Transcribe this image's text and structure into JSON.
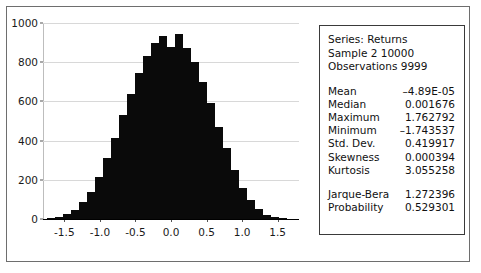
{
  "chart_data": {
    "type": "bar",
    "title": "",
    "xlabel": "",
    "ylabel": "",
    "xlim": [
      -1.8,
      1.8
    ],
    "ylim": [
      0,
      1000
    ],
    "grid": true,
    "legend": null,
    "y_ticks": [
      0,
      200,
      400,
      600,
      800,
      1000
    ],
    "y_tick_labels": [
      "0",
      "200",
      "400",
      "600",
      "800",
      "1000"
    ],
    "x_ticks": [
      -1.5,
      -1.0,
      -0.5,
      0.0,
      0.5,
      1.0,
      1.5
    ],
    "x_tick_labels": [
      "-1.5",
      "-1.0",
      "-0.5",
      "0.0",
      "0.5",
      "1.0",
      "1.5"
    ],
    "bin_width": 0.1125,
    "bin_centers": [
      -1.6875,
      -1.575,
      -1.4625,
      -1.35,
      -1.2375,
      -1.125,
      -1.0125,
      -0.9,
      -0.7875,
      -0.675,
      -0.5625,
      -0.45,
      -0.3375,
      -0.225,
      -0.1125,
      0.0,
      0.1125,
      0.225,
      0.3375,
      0.45,
      0.5625,
      0.675,
      0.7875,
      0.9,
      1.0125,
      1.125,
      1.2375,
      1.35,
      1.4625,
      1.575
    ],
    "values": [
      5,
      12,
      25,
      48,
      85,
      140,
      215,
      310,
      415,
      530,
      640,
      745,
      830,
      900,
      935,
      880,
      945,
      870,
      800,
      700,
      590,
      470,
      360,
      250,
      160,
      95,
      50,
      22,
      9,
      3
    ]
  },
  "stats": {
    "header": [
      "Series: Returns",
      "Sample 2 10000",
      "Observations 9999"
    ],
    "rows": [
      {
        "name": "Mean",
        "value": "–4.89E-05"
      },
      {
        "name": "Median",
        "value": "0.001676"
      },
      {
        "name": "Maximum",
        "value": "1.762792"
      },
      {
        "name": "Minimum",
        "value": "–1.743537"
      },
      {
        "name": "Std. Dev.",
        "value": "0.419917"
      },
      {
        "name": "Skewness",
        "value": "0.000394"
      },
      {
        "name": "Kurtosis",
        "value": "3.055258"
      }
    ],
    "tests": [
      {
        "name": "Jarque-Bera",
        "value": "1.272396"
      },
      {
        "name": "Probability",
        "value": "0.529301"
      }
    ]
  },
  "colors": {
    "bar": "#0a0a0a",
    "grid": "#d8d8d8",
    "axis": "#000000",
    "frame": "#6e6e6e",
    "panel_border": "#3a3a3a",
    "text": "#111111"
  }
}
